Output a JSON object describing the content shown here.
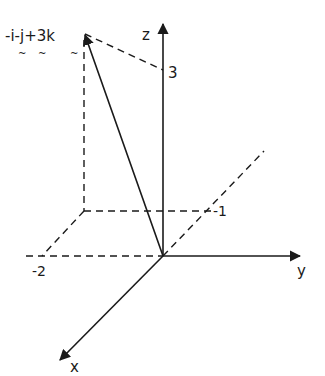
{
  "diagram": {
    "type": "3d-vector-axes",
    "colors": {
      "background": "#ffffff",
      "ink": "#1a1a1a"
    },
    "axes": {
      "z": {
        "label": "z",
        "tick_label": "3"
      },
      "y": {
        "label": "y",
        "tick_label": "-1"
      },
      "x": {
        "label": "x",
        "tick_label": "-2"
      }
    },
    "vector": {
      "label": "-i-j+3k",
      "tilde_marks": [
        "~",
        "~",
        "~"
      ],
      "components": {
        "i": -1,
        "j": -1,
        "k": 3
      }
    }
  }
}
